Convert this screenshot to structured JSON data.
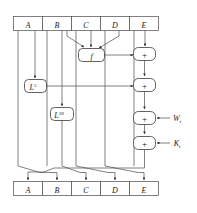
{
  "diagram": {
    "name": "sha1-round-function",
    "title": "",
    "colors": {
      "stroke": "#4a4a4a",
      "box_stroke": "#3a3a3a",
      "fill": "#ffffff",
      "text": "#1a1a1a"
    },
    "top_register": {
      "name": "input-register-row",
      "cells": [
        {
          "label": "A"
        },
        {
          "label": "B"
        },
        {
          "label": "C"
        },
        {
          "label": "D"
        },
        {
          "label": "E"
        }
      ]
    },
    "bottom_register": {
      "name": "output-register-row",
      "cells": [
        {
          "label": "A"
        },
        {
          "label": "B"
        },
        {
          "label": "C"
        },
        {
          "label": "D"
        },
        {
          "label": "E"
        }
      ]
    },
    "function_box": {
      "label": "f"
    },
    "rotate_boxes": [
      {
        "label": "L",
        "exponent": "5"
      },
      {
        "label": "L",
        "exponent": "30"
      }
    ],
    "adders": [
      {
        "label": "+"
      },
      {
        "label": "+"
      },
      {
        "label": "+"
      },
      {
        "label": "+"
      }
    ],
    "inputs": [
      {
        "label": "W",
        "subscript": "t"
      },
      {
        "label": "K",
        "subscript": "t"
      }
    ]
  }
}
